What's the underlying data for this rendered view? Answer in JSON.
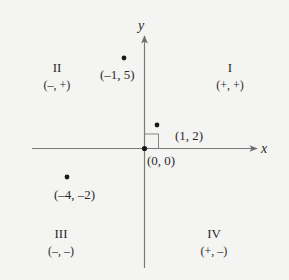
{
  "diagram": {
    "type": "coordinate-plane",
    "axes": {
      "x_label": "x",
      "y_label": "y"
    },
    "origin": {
      "label": "(0, 0)"
    },
    "quadrants": [
      {
        "numeral": "I",
        "signs": "(+, +)"
      },
      {
        "numeral": "II",
        "signs": "(–, +)"
      },
      {
        "numeral": "III",
        "signs": "(–, –)"
      },
      {
        "numeral": "IV",
        "signs": "(+, –)"
      }
    ],
    "points": [
      {
        "label": "(–1, 5)",
        "x": -1,
        "y": 5
      },
      {
        "label": "(1, 2)",
        "x": 1,
        "y": 2
      },
      {
        "label": "(–4, –2)",
        "x": -4,
        "y": -2
      }
    ],
    "colors": {
      "axis": "#7a7a7a",
      "point": "#1a1a1a",
      "text": "#2a2a2a",
      "background": "#f4f4f2"
    }
  }
}
